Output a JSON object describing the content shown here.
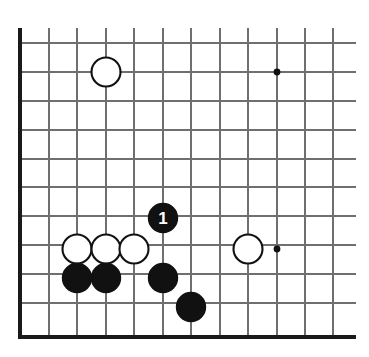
{
  "diagram": {
    "board_background": "#ffffff",
    "grid_line_color": "#6f6f6f",
    "edge_line_color": "#1a1a1a",
    "black_stone_color": "#111111",
    "white_stone_color": "#ffffff",
    "stone_outline_color": "#111111",
    "label_text_color": "#ffffff",
    "stone_radius": 14.5,
    "star_point_radius": 3.4,
    "grid": {
      "spacing": 28.6,
      "vertical_lines_x": [
        20,
        49,
        77,
        106,
        134,
        163,
        191,
        220,
        248,
        277,
        305,
        333
      ],
      "horizontal_lines_y": [
        43,
        72,
        101,
        130,
        159,
        187,
        216,
        245,
        274,
        303,
        337
      ],
      "left_edge_x": 20,
      "bottom_edge_y": 337,
      "right_extent_x": 356,
      "top_extent_y": 28
    },
    "star_points": [
      {
        "name": "star-point-upper-right",
        "x": 277,
        "y": 72
      },
      {
        "name": "star-point-lower-right",
        "x": 277,
        "y": 249
      }
    ],
    "stones": [
      {
        "name": "white-stone-upper-left",
        "color": "white",
        "x": 106,
        "y": 72,
        "label": ""
      },
      {
        "name": "black-stone-move-1",
        "color": "black",
        "x": 163,
        "y": 218,
        "label": "1"
      },
      {
        "name": "white-stone-row-a",
        "color": "white",
        "x": 77,
        "y": 249,
        "label": ""
      },
      {
        "name": "white-stone-row-b",
        "color": "white",
        "x": 106,
        "y": 249,
        "label": ""
      },
      {
        "name": "white-stone-row-c",
        "color": "white",
        "x": 134,
        "y": 249,
        "label": ""
      },
      {
        "name": "white-stone-right",
        "color": "white",
        "x": 248,
        "y": 249,
        "label": ""
      },
      {
        "name": "black-stone-row-a",
        "color": "black",
        "x": 77,
        "y": 278,
        "label": ""
      },
      {
        "name": "black-stone-row-b",
        "color": "black",
        "x": 106,
        "y": 278,
        "label": ""
      },
      {
        "name": "black-stone-row-c",
        "color": "black",
        "x": 163,
        "y": 278,
        "label": ""
      },
      {
        "name": "black-stone-bottom",
        "color": "black",
        "x": 191,
        "y": 307,
        "label": ""
      }
    ]
  }
}
